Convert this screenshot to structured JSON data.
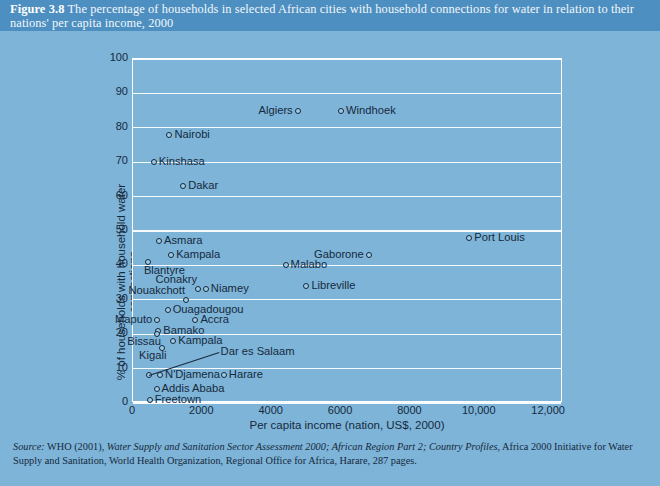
{
  "header": {
    "figure_number": "Figure 3.8",
    "caption": "The percentage of households in selected African cities with household connections for water in relation to their nations' per capita income, 2000",
    "band_color": "#4d8fc0"
  },
  "page": {
    "background_color": "#7db4d8",
    "ink_color": "#17293c"
  },
  "source": {
    "prefix": "Source:",
    "text_before_italic": " WHO (2001), ",
    "italic_title": "Water Supply and Sanitation Sector Assessment 2000; African Region Part 2; Country Profiles",
    "text_after_italic": ", Africa 2000 Initiative for Water Supply and Sanitation, World Health Organization, Regional Office for Africa, Harare, 287 pages."
  },
  "chart_data": {
    "type": "scatter",
    "title": "The percentage of households in selected African cities with household connections for water in relation to their nations' per capita income, 2000",
    "xlabel": "Per capita income (nation, US$, 2000)",
    "ylabel": "% of households with household water connections",
    "xlim": [
      0,
      12400
    ],
    "ylim": [
      0,
      100
    ],
    "xticks": [
      0,
      2000,
      4000,
      6000,
      8000,
      10000,
      12000
    ],
    "xtick_labels": [
      "0",
      "2000",
      "4000",
      "6000",
      "8000",
      "10,000",
      "12,000"
    ],
    "yticks": [
      0,
      10,
      20,
      30,
      40,
      50,
      60,
      70,
      80,
      90,
      100
    ],
    "ytick_labels": [
      "0",
      "10",
      "20",
      "30",
      "40",
      "50",
      "60",
      "70",
      "80",
      "90",
      "100"
    ],
    "grid": "horizontal",
    "legend": "none",
    "marker_style": "open-circle",
    "points": [
      {
        "label": "Algiers",
        "x": 4750,
        "y": 85,
        "lpos": "left"
      },
      {
        "label": "Windhoek",
        "x": 6000,
        "y": 85,
        "lpos": "right"
      },
      {
        "label": "Nairobi",
        "x": 1050,
        "y": 78,
        "lpos": "right"
      },
      {
        "label": "Kinshasa",
        "x": 600,
        "y": 70,
        "lpos": "right"
      },
      {
        "label": "Dakar",
        "x": 1450,
        "y": 63,
        "lpos": "right"
      },
      {
        "label": "Port Louis",
        "x": 9700,
        "y": 48,
        "lpos": "right"
      },
      {
        "label": "Asmara",
        "x": 750,
        "y": 47,
        "lpos": "right"
      },
      {
        "label": "Kampala",
        "x": 1100,
        "y": 43,
        "lpos": "right"
      },
      {
        "label": "Gaborone",
        "x": 6800,
        "y": 43,
        "lpos": "left"
      },
      {
        "label": "Blantyre",
        "x": 430,
        "y": 41,
        "lpos": "below"
      },
      {
        "label": "Malabo",
        "x": 4400,
        "y": 40,
        "lpos": "right"
      },
      {
        "label": "Conakry",
        "x": 1880,
        "y": 33,
        "lpos": "above-left"
      },
      {
        "label": "Niamey",
        "x": 2100,
        "y": 33,
        "lpos": "right"
      },
      {
        "label": "Libreville",
        "x": 5000,
        "y": 34,
        "lpos": "right"
      },
      {
        "label": "Nouakchott",
        "x": 1530,
        "y": 30,
        "lpos": "above-left"
      },
      {
        "label": "Ouagadougou",
        "x": 1000,
        "y": 27,
        "lpos": "right"
      },
      {
        "label": "Accra",
        "x": 1800,
        "y": 24,
        "lpos": "right"
      },
      {
        "label": "Maputo",
        "x": 700,
        "y": 24,
        "lpos": "left"
      },
      {
        "label": "Bamako",
        "x": 730,
        "y": 21,
        "lpos": "right"
      },
      {
        "label": "Bissau",
        "x": 690,
        "y": 20,
        "lpos": "below-left"
      },
      {
        "label": "Kampala",
        "x": 1160,
        "y": 18,
        "lpos": "right"
      },
      {
        "label": "Kigali",
        "x": 850,
        "y": 16,
        "lpos": "below-left"
      },
      {
        "label": "Dar es Salaam",
        "x": 450,
        "y": 8,
        "lpos": "leader"
      },
      {
        "label": "N'Djamena",
        "x": 780,
        "y": 8,
        "lpos": "right"
      },
      {
        "label": "Harare",
        "x": 2620,
        "y": 8,
        "lpos": "right"
      },
      {
        "label": "Addis Ababa",
        "x": 680,
        "y": 4,
        "lpos": "right"
      },
      {
        "label": "Freetown",
        "x": 480,
        "y": 1,
        "lpos": "right"
      }
    ]
  }
}
